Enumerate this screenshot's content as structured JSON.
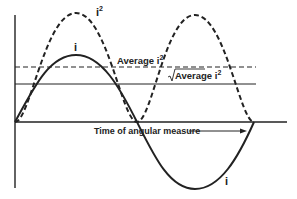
{
  "diagram": {
    "labels": {
      "i_squared": "i",
      "i_squared_sup": "2",
      "i_curve_top": "i",
      "i_curve_bottom": "i",
      "average_i2": "Average i",
      "average_i2_sup": "2",
      "rms": "Average i",
      "rms_sup": "2",
      "time_axis": "Time of angular measure"
    },
    "curves": [
      {
        "name": "i",
        "style": "solid",
        "description": "sinusoidal current"
      },
      {
        "name": "i^2",
        "style": "dashed",
        "description": "square of current"
      },
      {
        "name": "Average i^2",
        "style": "dashed",
        "description": "horizontal mean of i^2"
      },
      {
        "name": "sqrt(Average i^2)",
        "style": "solid",
        "description": "horizontal RMS level"
      }
    ],
    "colors": {
      "ink": "#222222",
      "background": "#ffffff"
    }
  }
}
